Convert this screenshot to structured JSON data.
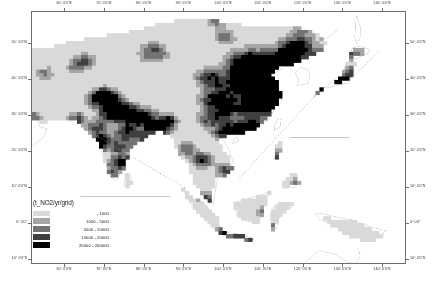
{
  "figure": {
    "name": "asia-no2-emission-grid-map",
    "projection_note": "geographic-graticule"
  },
  "legend": {
    "title": "(t_NO2/yr/grid)",
    "entries": [
      {
        "label": "-  1000",
        "color": "#d9d9d9",
        "min": 0,
        "max": 1000
      },
      {
        "label": "1000  -  5000",
        "color": "#a6a6a6",
        "min": 1000,
        "max": 5000
      },
      {
        "label": "5000  -  10000",
        "color": "#737373",
        "min": 5000,
        "max": 10000
      },
      {
        "label": "10000  -  20000",
        "color": "#3f3f3f",
        "min": 10000,
        "max": 20000
      },
      {
        "label": "20000  -  200000",
        "color": "#000000",
        "min": 20000,
        "max": 200000
      }
    ]
  },
  "axes": {
    "x_labels": [
      "60° 0'0\"E",
      "70° 0'0\"E",
      "80° 0'0\"E",
      "90° 0'0\"E",
      "100° 0'0\"E",
      "110° 0'0\"E",
      "120° 0'0\"E",
      "130° 0'0\"E",
      "140° 0'0\"E",
      "150° 0'0\"E"
    ],
    "x_positions_pct": [
      8.8,
      19.4,
      30.0,
      40.6,
      51.2,
      61.8,
      72.4,
      83.0,
      93.6,
      104.2
    ],
    "y_labels": [
      "50° 0'0\"N",
      "40° 0'0\"N",
      "30° 0'0\"N",
      "20° 0'0\"N",
      "10° 0'0\"N",
      "0° 0'0\"",
      "10° 0'0\"S"
    ],
    "y_positions_pct": [
      12.6,
      26.9,
      41.1,
      55.3,
      69.6,
      83.8,
      98.0
    ]
  },
  "chart_data": {
    "type": "heatmap",
    "title": "(t_NO2/yr/grid)",
    "xlabel": "Longitude",
    "ylabel": "Latitude",
    "xlim": [
      "55E",
      "155E"
    ],
    "ylim": [
      "15S",
      "55N"
    ],
    "grid": true,
    "legend_position": "bottom-left-inside",
    "classes": [
      {
        "label": "-  1000",
        "color": "#d9d9d9"
      },
      {
        "label": "1000  -  5000",
        "color": "#a6a6a6"
      },
      {
        "label": "5000  -  10000",
        "color": "#737373"
      },
      {
        "label": "10000  -  20000",
        "color": "#3f3f3f"
      },
      {
        "label": "20000  -  200000",
        "color": "#000000"
      }
    ]
  }
}
